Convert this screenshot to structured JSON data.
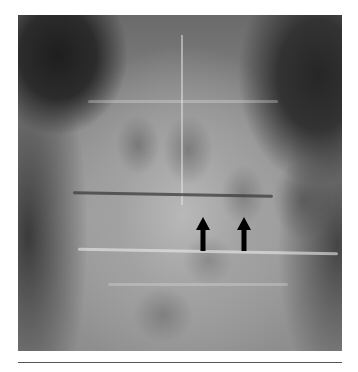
{
  "figure": {
    "type": "radiograph",
    "annotations": [
      {
        "kind": "arrow",
        "direction": "up",
        "x": 203,
        "y_top": 217,
        "y_bottom": 250,
        "color": "#000000"
      },
      {
        "kind": "arrow",
        "direction": "up",
        "x": 244,
        "y_top": 217,
        "y_bottom": 250,
        "color": "#000000"
      }
    ]
  },
  "colors": {
    "background": "#ffffff",
    "arrow": "#000000",
    "rule": "#555555"
  }
}
